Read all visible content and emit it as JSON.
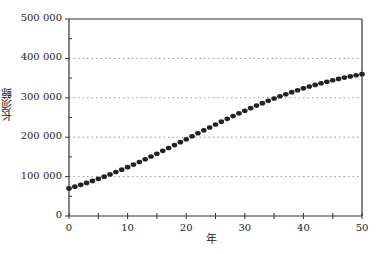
{
  "chart_data": {
    "type": "scatter",
    "title": "",
    "xlabel": "年",
    "ylabel": "长须鲸",
    "xlim": [
      0,
      50
    ],
    "ylim": [
      0,
      500000
    ],
    "x_ticks": [
      0,
      10,
      20,
      30,
      40,
      50
    ],
    "x_tick_labels": [
      "0",
      "10",
      "20",
      "30",
      "40",
      "50"
    ],
    "y_ticks": [
      0,
      100000,
      200000,
      300000,
      400000,
      500000
    ],
    "y_tick_labels": [
      "0",
      "100 000",
      "200 000",
      "300 000",
      "400 000",
      "500 000"
    ],
    "grid": "horizontal dotted",
    "legend": null,
    "series": [
      {
        "name": "长须鲸",
        "marker": "filled-circle",
        "color": "#222222",
        "x": [
          0,
          1,
          2,
          3,
          4,
          5,
          6,
          7,
          8,
          9,
          10,
          11,
          12,
          13,
          14,
          15,
          16,
          17,
          18,
          19,
          20,
          21,
          22,
          23,
          24,
          25,
          26,
          27,
          28,
          29,
          30,
          31,
          32,
          33,
          34,
          35,
          36,
          37,
          38,
          39,
          40,
          41,
          42,
          43,
          44,
          45,
          46,
          47,
          48,
          49,
          50
        ],
        "values": [
          70000,
          74438,
          79088,
          83951,
          89037,
          94337,
          99850,
          105574,
          111504,
          117636,
          123962,
          130463,
          137141,
          143977,
          150959,
          158071,
          165296,
          172615,
          180010,
          187459,
          194941,
          202439,
          209930,
          217403,
          224807,
          232167,
          239421,
          246579,
          253598,
          260485,
          267219,
          273785,
          280171,
          286369,
          292376,
          298174,
          303767,
          309143,
          314284,
          319234,
          323966,
          328461,
          332779,
          336870,
          340744,
          344441,
          347917,
          351247,
          354359,
          357302,
          360036
        ]
      }
    ]
  }
}
